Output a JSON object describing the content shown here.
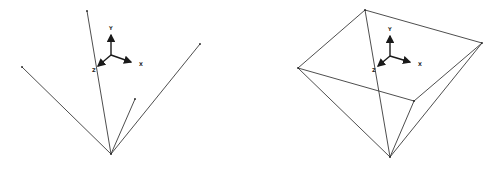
{
  "figures": [
    {
      "name": "edges-only",
      "apex": [
        111,
        154
      ],
      "endpoints": [
        [
          87,
          11
        ],
        [
          22,
          67
        ],
        [
          200,
          44
        ],
        [
          135,
          99
        ]
      ],
      "axes_origin": [
        110,
        55
      ],
      "axis_labels": {
        "x": "X",
        "y": "Y",
        "z": "Z"
      }
    },
    {
      "name": "pyramid",
      "apex": [
        390,
        157
      ],
      "base": [
        [
          365,
          10
        ],
        [
          482,
          43
        ],
        [
          414,
          101
        ],
        [
          298,
          68
        ]
      ],
      "axes_origin": [
        390,
        56
      ],
      "axis_labels": {
        "x": "X",
        "y": "Y",
        "z": "Z"
      }
    }
  ],
  "colors": {
    "line": "#3a3a3a",
    "axis": "#1a1a1a",
    "background": "#ffffff"
  }
}
